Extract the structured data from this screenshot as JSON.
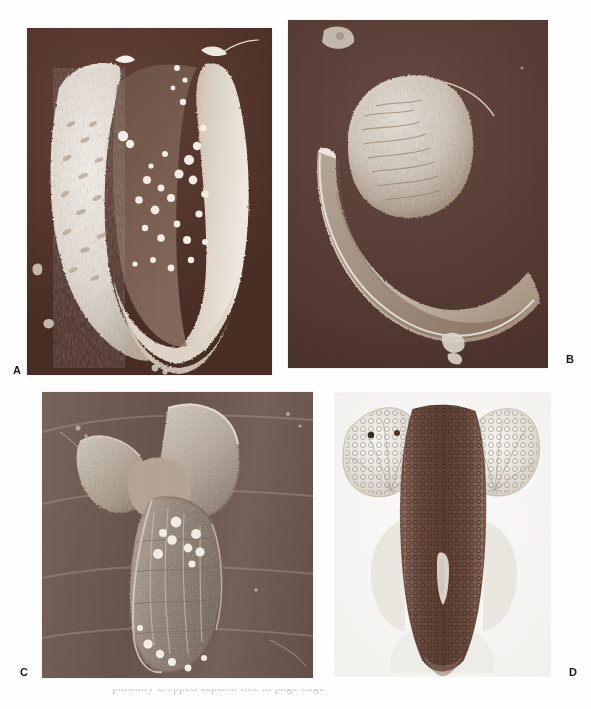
{
  "figure": {
    "background_color": "#fefefe",
    "layout": "2x2-panel-plate",
    "panels": [
      {
        "id": "A",
        "label": "A",
        "label_position": "bottom-left-outside",
        "imaging_mode": "scanning-electron-micrograph",
        "background_color": "#5d3a30",
        "specimen_color": "#efe9e2",
        "description": "U-shaped cupped specimen with granular reticulate surface and scattered spherical granules",
        "frame": {
          "x": 27,
          "y": 28,
          "width": 245,
          "height": 347
        }
      },
      {
        "id": "B",
        "label": "B",
        "label_position": "bottom-right-outside",
        "imaging_mode": "scanning-electron-micrograph",
        "background_color": "#5e4038",
        "specimen_color": "#e6dfd7",
        "description": "Crescent shaped specimen with rounded upper lobe and tapering curved lower arm",
        "frame": {
          "x": 288,
          "y": 20,
          "width": 260,
          "height": 348
        }
      },
      {
        "id": "C",
        "label": "C",
        "label_position": "bottom-left-outside",
        "imaging_mode": "scanning-electron-micrograph",
        "background_color": "#6d584f",
        "specimen_color": "#d8cec4",
        "description": "Anchor shaped specimen with two flared upper lobes and an elongate ridged lower body bearing spherical granules",
        "frame": {
          "x": 42,
          "y": 392,
          "width": 271,
          "height": 286
        }
      },
      {
        "id": "D",
        "label": "D",
        "label_position": "bottom-right-outside",
        "imaging_mode": "light-micrograph",
        "background_color": "#f4f3f0",
        "specimen_color": "#6b4b40",
        "description": "Transmitted light view of bilaterally symmetric specimen with two pale lateral wings and a dark reticulate median column",
        "frame": {
          "x": 335,
          "y": 393,
          "width": 215,
          "height": 283
        }
      }
    ]
  },
  "caption": {
    "cropped_line": "partially cropped caption line at page edge"
  }
}
